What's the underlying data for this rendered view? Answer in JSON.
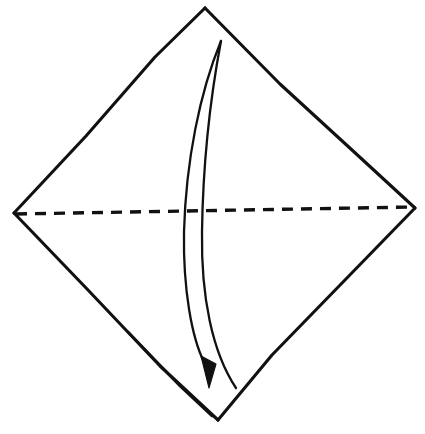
{
  "figure": {
    "title": "Origami fold step diagram",
    "background_color": "#ffffff",
    "ink_color": "#111111",
    "canvas": {
      "width": 425,
      "height": 434
    }
  },
  "paper": {
    "label": "square sheet of paper",
    "orientation": "diamond",
    "vertices": {
      "top": {
        "label": "top corner",
        "x": 205,
        "y": 8
      },
      "right": {
        "label": "right corner",
        "x": 415,
        "y": 208
      },
      "bottom": {
        "label": "bottom corner",
        "x": 218,
        "y": 420
      },
      "left": {
        "label": "left corner",
        "x": 14,
        "y": 213
      }
    },
    "edges": [
      {
        "name": "top-left-edge",
        "path": "M 14 213 L 86 136 L 155 57 L 205 8"
      },
      {
        "name": "top-right-edge",
        "path": "M 205 8 L 280 84 L 352 150 L 415 208"
      },
      {
        "name": "bottom-right-edge",
        "path": "M 415 208 L 344 281 L 272 355 L 218 420"
      },
      {
        "name": "bottom-left-edge",
        "path": "M 14 213 L 88 290 L 160 366 L 218 420"
      },
      {
        "name": "bottom-left-edge-overdraw",
        "path": "M 128 332 L 180 386 L 212 416"
      }
    ]
  },
  "crease": {
    "label": "valley fold crease line",
    "style": "dashed",
    "path": "M 16 214 L 414 207",
    "dash_length": 11,
    "gap_length": 8
  },
  "fold_arrow": {
    "label": "fold arrow: top corner down to bottom corner",
    "direction": "top to bottom",
    "tail": {
      "x": 221,
      "y": 40
    },
    "tip": {
      "x": 209,
      "y": 386
    },
    "left_stroke_path": "M 221 41 C 200 92, 186 160, 184 232 C 183 290, 192 338, 204 362",
    "right_stroke_path": "M 221 41 C 211 94, 203 160, 202 232 C 201 296, 212 352, 236 388",
    "head_points": "201,356 216,364 209,388"
  }
}
